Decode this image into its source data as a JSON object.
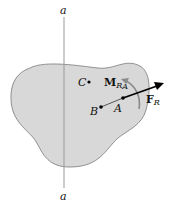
{
  "diagram": {
    "axis": {
      "top_label": "a",
      "bottom_label": "a"
    },
    "points": {
      "A": "A",
      "B": "B",
      "C": "C"
    },
    "moment": {
      "symbol": "M",
      "subscript": "RA",
      "sub_main": "R",
      "sub_small": "A"
    },
    "force": {
      "symbol": "F",
      "subscript": "R"
    },
    "colors": {
      "body_fill": "#d8d8d8",
      "body_stroke": "#7a7a7a",
      "moment_arrow": "#8a8a8a",
      "force_arrow": "#000000",
      "axis_line": "#999999"
    }
  }
}
